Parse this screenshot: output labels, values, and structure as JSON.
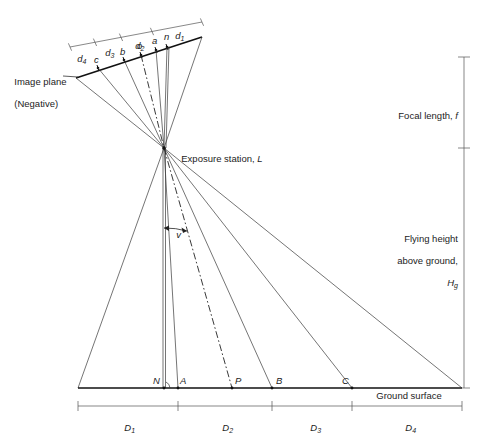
{
  "figure": {
    "title_caption": "",
    "image_plane_label_line1": "Image plane",
    "image_plane_label_line2": "(Negative)",
    "exposure_station_label": "Exposure station, ",
    "exposure_station_symbol": "L",
    "focal_length_label": "Focal length, ",
    "focal_length_symbol": "f",
    "flying_height_line1": "Flying height",
    "flying_height_line2": "above ground,",
    "flying_height_symbol": "H",
    "flying_height_subscript": "g",
    "ground_surface_label": "Ground surface",
    "angle_label": "v"
  },
  "image_plane": {
    "points": [
      {
        "id": "c",
        "label": "c",
        "x": 98,
        "y": 68
      },
      {
        "id": "b",
        "label": "b",
        "x": 124,
        "y": 60
      },
      {
        "id": "o",
        "label": "o",
        "x": 141,
        "y": 55
      },
      {
        "id": "a",
        "label": "a",
        "x": 156,
        "y": 50
      },
      {
        "id": "n",
        "label": "n",
        "x": 167,
        "y": 47
      }
    ],
    "dimensions": [
      {
        "id": "d4",
        "label": "d",
        "subscript": "4"
      },
      {
        "id": "d3",
        "label": "d",
        "subscript": "3"
      },
      {
        "id": "d2",
        "label": "d",
        "subscript": "2"
      },
      {
        "id": "d1",
        "label": "d",
        "subscript": "1"
      }
    ]
  },
  "ground": {
    "points": [
      {
        "id": "N",
        "label": "N",
        "x": 164,
        "y": 388
      },
      {
        "id": "A",
        "label": "A",
        "x": 178,
        "y": 388
      },
      {
        "id": "P",
        "label": "P",
        "x": 232,
        "y": 388
      },
      {
        "id": "B",
        "label": "B",
        "x": 272,
        "y": 388
      },
      {
        "id": "C",
        "label": "C",
        "x": 352,
        "y": 388
      }
    ],
    "dimensions": [
      {
        "id": "D1",
        "label": "D",
        "subscript": "1"
      },
      {
        "id": "D2",
        "label": "D",
        "subscript": "2"
      },
      {
        "id": "D3",
        "label": "D",
        "subscript": "3"
      },
      {
        "id": "D4",
        "label": "D",
        "subscript": "4"
      }
    ]
  },
  "colors": {
    "line": "#1a1a1a",
    "thin": "#4a4a4a",
    "background": "#ffffff"
  }
}
